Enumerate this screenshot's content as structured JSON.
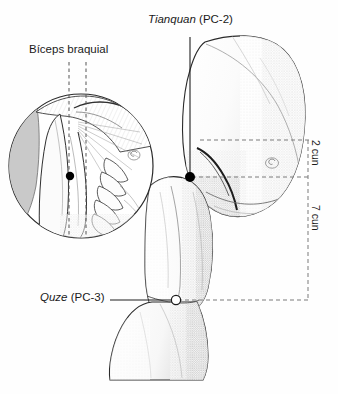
{
  "figure": {
    "type": "anatomical-illustration",
    "background_color": "#fefefe",
    "ink_color": "#1a1a1a",
    "labels": {
      "tianquan": {
        "name": "Tianquan",
        "code": "(PC-2)",
        "full": "Tianquan (PC-2)"
      },
      "biceps": {
        "full": "Bíceps braquial"
      },
      "quze": {
        "name": "Quze",
        "code": "(PC-3)",
        "full": "Quze (PC-3)"
      },
      "cun_2": "2 cun",
      "cun_7": "7 cun"
    },
    "points": [
      {
        "id": "pc-2",
        "label": "Tianquan (PC-2)",
        "marker": "filled-dot",
        "x": 190,
        "y": 177
      },
      {
        "id": "pc-3",
        "label": "Quze (PC-3)",
        "marker": "open-circle",
        "x": 176,
        "y": 300
      },
      {
        "id": "pc-2-inset",
        "label": "Tianquan (PC-2)",
        "marker": "filled-dot",
        "x": 70,
        "y": 176
      }
    ],
    "measurements": [
      {
        "label": "2 cun",
        "from_y": 140,
        "to_y": 177
      },
      {
        "label": "7 cun",
        "from_y": 177,
        "to_y": 300
      }
    ],
    "markers": {
      "nipple_main": {
        "x": 272,
        "y": 163
      },
      "nipple_inset": {
        "x": 134,
        "y": 155
      }
    }
  }
}
